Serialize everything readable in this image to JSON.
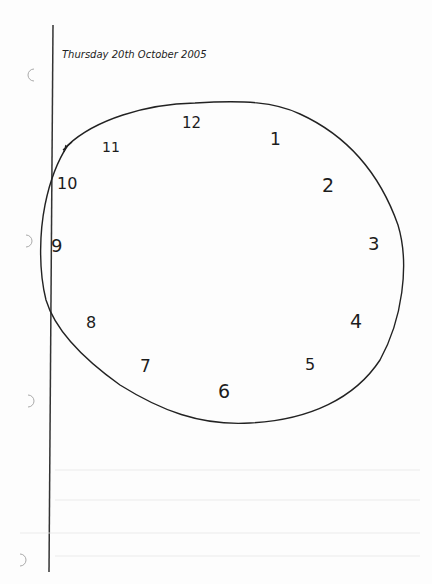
{
  "header": {
    "date_text": "Thursday 20th October 2005"
  },
  "clock": {
    "numerals": [
      {
        "label": "12",
        "x": 182,
        "y": 128
      },
      {
        "label": "1",
        "x": 272,
        "y": 140
      },
      {
        "label": "2",
        "x": 325,
        "y": 188
      },
      {
        "label": "3",
        "x": 370,
        "y": 250
      },
      {
        "label": "4",
        "x": 352,
        "y": 325
      },
      {
        "label": "5",
        "x": 308,
        "y": 368
      },
      {
        "label": "6",
        "x": 222,
        "y": 396
      },
      {
        "label": "7",
        "x": 143,
        "y": 370
      },
      {
        "label": "8",
        "x": 89,
        "y": 325
      },
      {
        "label": "9",
        "x": 54,
        "y": 250
      },
      {
        "label": "10",
        "x": 58,
        "y": 188
      },
      {
        "label": "11",
        "x": 104,
        "y": 150
      },
      {
        "label": "tick",
        "x": 68,
        "y": 148
      }
    ]
  },
  "paper": {
    "margin_line_color": "#333333",
    "ink_color": "#1c1c1c"
  }
}
